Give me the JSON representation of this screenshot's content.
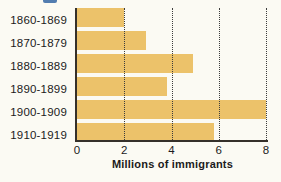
{
  "header": {
    "cropped_title_fragment": "bottom sliver of blue title text cut off at top edge"
  },
  "chart_data": {
    "type": "bar",
    "orientation": "horizontal",
    "title": "",
    "xlabel": "Millions of immigrants",
    "categories": [
      "1860-1869",
      "1870-1879",
      "1880-1889",
      "1890-1899",
      "1900-1909",
      "1910-1919"
    ],
    "values": [
      2.0,
      2.9,
      4.9,
      3.8,
      8.0,
      5.8
    ],
    "x_ticks": [
      "0",
      "2",
      "4",
      "6",
      "8"
    ],
    "xlim": [
      0,
      8
    ],
    "grid": {
      "style": "dotted",
      "orientation": "vertical",
      "at_values": [
        2,
        4,
        6,
        8
      ]
    },
    "legend": "none",
    "colors": {
      "bar": "#ecc26a",
      "axis": "#35302a",
      "grid": "#3c3c3c",
      "text": "#1b1b1b",
      "background": "#fbfaf3",
      "cropped_fragment": "#3f6fa8"
    }
  }
}
